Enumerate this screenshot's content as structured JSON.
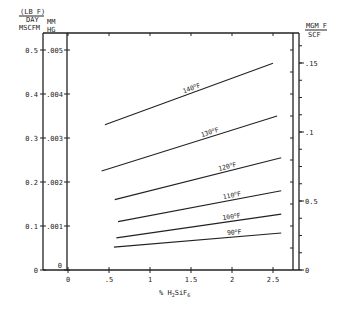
{
  "chart_data": {
    "type": "line",
    "title": "",
    "xlabel": "% H2SiF6",
    "xlabel_main": "% H",
    "xlabel_sub1": "2",
    "xlabel_mid": "SiF",
    "xlabel_sub2": "6",
    "xlim": [
      -0.2,
      2.7
    ],
    "x_ticks": [
      "0",
      ".5",
      "1",
      "1.5",
      "2",
      "2.5"
    ],
    "x_tick_values": [
      0,
      0.5,
      1,
      1.5,
      2,
      2.5
    ],
    "y_left_outer": {
      "label_line1": "(LB F)",
      "label_line2": "DAY",
      "label_line3": "MSCFM",
      "ticks": [
        "0",
        "0.1",
        "0.2",
        "0.3",
        "0.4",
        "0.5"
      ],
      "tick_values": [
        0,
        0.1,
        0.2,
        0.3,
        0.4,
        0.5
      ],
      "ylim": [
        0,
        0.54
      ]
    },
    "y_left_inner": {
      "label_line1": "MM",
      "label_line2": "HG",
      "ticks": [
        "0",
        ".001",
        ".002",
        ".003",
        ".004",
        ".005"
      ],
      "tick_values": [
        0,
        0.001,
        0.002,
        0.003,
        0.004,
        0.005
      ]
    },
    "y_right": {
      "label_line1": "MGM F",
      "label_line2": "SCF",
      "ticks": [
        "0",
        "0.5",
        ".1",
        ".15"
      ],
      "tick_values": [
        0,
        0.05,
        0.1,
        0.15
      ]
    },
    "grid": false,
    "legend": "inline labels on curves",
    "series": [
      {
        "name": "140°F",
        "label": "140",
        "x": [
          0.45,
          2.5
        ],
        "y": [
          0.33,
          0.47
        ]
      },
      {
        "name": "130°F",
        "label": "130",
        "x": [
          0.41,
          2.55
        ],
        "y": [
          0.225,
          0.35
        ]
      },
      {
        "name": "120°F",
        "label": "120",
        "x": [
          0.57,
          2.6
        ],
        "y": [
          0.16,
          0.255
        ]
      },
      {
        "name": "110°F",
        "label": "110",
        "x": [
          0.61,
          2.6
        ],
        "y": [
          0.11,
          0.18
        ]
      },
      {
        "name": "100°F",
        "label": "100",
        "x": [
          0.59,
          2.6
        ],
        "y": [
          0.073,
          0.127
        ]
      },
      {
        "name": "90°F",
        "label": "90",
        "x": [
          0.56,
          2.6
        ],
        "y": [
          0.052,
          0.084
        ]
      }
    ],
    "degree_suffix": "o",
    "unit_suffix": "F"
  }
}
